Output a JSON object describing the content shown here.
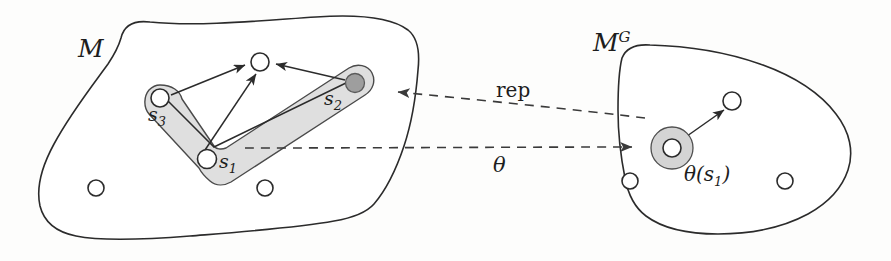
{
  "figure": {
    "caption_absent": true,
    "background_color": "#fdfdfc",
    "width": 891,
    "height": 261
  },
  "labels": {
    "manifold_source": "M",
    "manifold_goal_base": "M",
    "manifold_goal_sup": "G",
    "state_1_base": "s",
    "state_1_sub": "1",
    "state_2_base": "s",
    "state_2_sub": "2",
    "state_3_base": "s",
    "state_3_sub": "3",
    "rep_map": "rep",
    "theta_map": "θ",
    "theta_applied_prefix": "θ(s",
    "theta_applied_sub": "1",
    "theta_applied_suffix": ")"
  },
  "colors": {
    "outline": "#2b2b2b",
    "band_fill": "#d9d9d9",
    "band_stroke": "#4a4a4a",
    "node_open_fill": "#ffffff",
    "node_filled_fill": "#9e9e9e",
    "annulus_fill": "#d4d4d4",
    "dashed_arrow": "#3a3a3a"
  },
  "diagram_data": {
    "type": "diagram",
    "description": "Two manifold blobs connected by dashed mapping arrows",
    "source_manifold": {
      "name": "M",
      "band_label": "shaded bent band region containing s1, s2, s3",
      "nodes": [
        {
          "id": "s3",
          "label": "s_3",
          "style": "open",
          "cx": 160,
          "cy": 98,
          "r": 9
        },
        {
          "id": "s1",
          "label": "s_1",
          "style": "open",
          "cx": 207,
          "cy": 159,
          "r": 9.5
        },
        {
          "id": "s2",
          "label": "s_2",
          "style": "filled",
          "cx": 355,
          "cy": 83,
          "r": 9.5
        },
        {
          "id": "center",
          "label": "",
          "style": "open",
          "cx": 260,
          "cy": 62,
          "r": 9
        },
        {
          "id": "free_a",
          "label": "",
          "style": "open",
          "cx": 96,
          "cy": 188,
          "r": 8
        },
        {
          "id": "free_b",
          "label": "",
          "style": "open",
          "cx": 265,
          "cy": 188,
          "r": 8
        }
      ],
      "edges": [
        {
          "from": "s3",
          "to": "center",
          "arrow": true
        },
        {
          "from": "s1",
          "to": "center",
          "arrow": true
        },
        {
          "from": "s2",
          "to": "center",
          "arrow": true
        },
        {
          "from": "s3",
          "to": "bend",
          "arrow": false
        },
        {
          "from": "s1",
          "to": "s2",
          "arrow": false
        }
      ]
    },
    "goal_manifold": {
      "name": "M^G",
      "nodes": [
        {
          "id": "theta_s1",
          "label": "θ(s_1)",
          "style": "annulus",
          "cx": 672,
          "cy": 148,
          "r_outer": 21,
          "r_inner": 9
        },
        {
          "id": "goal_node",
          "label": "",
          "style": "open",
          "cx": 732,
          "cy": 101,
          "r": 9
        },
        {
          "id": "free_c",
          "label": "",
          "style": "open",
          "cx": 630,
          "cy": 181,
          "r": 8
        },
        {
          "id": "free_d",
          "label": "",
          "style": "open",
          "cx": 785,
          "cy": 181,
          "r": 8
        }
      ],
      "edges": [
        {
          "from": "theta_s1",
          "to": "goal_node",
          "arrow": true
        }
      ]
    },
    "mappings": [
      {
        "label": "rep",
        "direction": "goal-to-source",
        "style": "dashed",
        "from": [
          645,
          118
        ],
        "to": [
          392,
          92
        ]
      },
      {
        "label": "θ",
        "direction": "source-to-goal",
        "style": "dashed",
        "from": [
          245,
          148
        ],
        "to": [
          638,
          147
        ]
      }
    ]
  }
}
